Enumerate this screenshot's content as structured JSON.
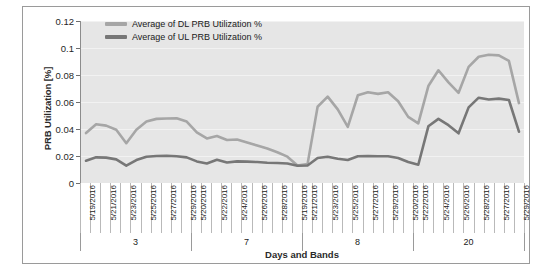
{
  "chart_data": {
    "type": "line",
    "title": "",
    "xlabel": "Days and Bands",
    "ylabel": "PRB Utilization [%]",
    "ylim": [
      0,
      0.12
    ],
    "y_ticks": [
      "0",
      "0.02",
      "0.04",
      "0.06",
      "0.08",
      "0.1",
      "0.12"
    ],
    "y_tick_values": [
      0,
      0.02,
      0.04,
      0.06,
      0.08,
      0.1,
      0.12
    ],
    "grid": true,
    "legend_position": "top-left-inside",
    "categories": [
      "5/19/2016",
      "5/20/2016",
      "5/21/2016",
      "5/22/2016",
      "5/23/2016",
      "5/24/2016",
      "5/25/2016",
      "5/26/2016",
      "5/27/2016",
      "5/28/2016",
      "5/29/2016",
      "5/19/2016",
      "5/20/2016",
      "5/21/2016",
      "5/22/2016",
      "5/23/2016",
      "5/24/2016",
      "5/25/2016",
      "5/26/2016",
      "5/27/2016",
      "5/28/2016",
      "5/29/2016",
      "5/19/2016",
      "5/20/2016",
      "5/21/2016",
      "5/22/2016",
      "5/23/2016",
      "5/24/2016",
      "5/25/2016",
      "5/26/2016",
      "5/27/2016",
      "5/28/2016",
      "5/29/2016",
      "5/19/2016",
      "5/20/2016",
      "5/21/2016",
      "5/22/2016",
      "5/23/2016",
      "5/24/2016",
      "5/25/2016",
      "5/26/2016",
      "5/27/2016",
      "5/28/2016",
      "5/29/2016"
    ],
    "visible_tick_labels": [
      "5/19/2016",
      "5/21/2016",
      "5/23/2016",
      "5/25/2016",
      "5/27/2016",
      "5/29/2016",
      "5/20/2016",
      "5/22/2016",
      "5/24/2016",
      "5/26/2016",
      "5/28/2016",
      "5/19/2016",
      "5/21/2016",
      "5/23/2016",
      "5/25/2016",
      "5/27/2016",
      "5/29/2016",
      "5/20/2016",
      "5/22/2016",
      "5/24/2016",
      "5/26/2016",
      "5/28/2016"
    ],
    "groups": [
      {
        "label": "3",
        "count": 11
      },
      {
        "label": "7",
        "count": 11
      },
      {
        "label": "8",
        "count": 11
      },
      {
        "label": "20",
        "count": 11
      }
    ],
    "series": [
      {
        "name": "Average of DL PRB Utilization %",
        "color": "#a6a6a6",
        "values": [
          0.037,
          0.0435,
          0.0425,
          0.0395,
          0.0295,
          0.0395,
          0.0455,
          0.0475,
          0.0478,
          0.048,
          0.0455,
          0.0375,
          0.033,
          0.0348,
          0.0318,
          0.0322,
          0.03,
          0.0278,
          0.0255,
          0.0228,
          0.0195,
          0.013,
          0.014,
          0.0565,
          0.064,
          0.0545,
          0.0415,
          0.065,
          0.0672,
          0.066,
          0.0672,
          0.0605,
          0.049,
          0.0442,
          0.0718,
          0.0835,
          0.0745,
          0.0668,
          0.086,
          0.0935,
          0.095,
          0.0945,
          0.0905,
          0.0592
        ]
      },
      {
        "name": "Average of UL PRB Utilization %",
        "color": "#777777",
        "values": [
          0.0165,
          0.019,
          0.0188,
          0.0175,
          0.0128,
          0.017,
          0.0195,
          0.02,
          0.0202,
          0.0198,
          0.019,
          0.016,
          0.0145,
          0.0172,
          0.0152,
          0.016,
          0.0158,
          0.0155,
          0.015,
          0.0148,
          0.0145,
          0.0128,
          0.013,
          0.0185,
          0.0195,
          0.018,
          0.017,
          0.0198,
          0.02,
          0.0198,
          0.0198,
          0.0185,
          0.0155,
          0.0135,
          0.042,
          0.0475,
          0.0428,
          0.0368,
          0.056,
          0.0632,
          0.0618,
          0.0625,
          0.0615,
          0.038
        ]
      }
    ]
  },
  "legend": {
    "items": [
      {
        "label": "Average of DL PRB Utilization %",
        "color": "#a6a6a6"
      },
      {
        "label": "Average of UL PRB Utilization %",
        "color": "#777777"
      }
    ]
  },
  "axes": {
    "y_title": "PRB Utilization [%]",
    "x_title": "Days and Bands"
  }
}
